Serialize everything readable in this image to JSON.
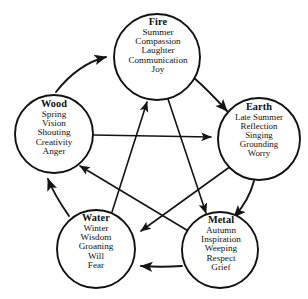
{
  "diagram": {
    "type": "five-elements-cycle",
    "line_color": "#141414",
    "background_color": "#ffffff",
    "nodes": [
      {
        "id": "fire",
        "name": "Fire",
        "attributes": [
          "Summer",
          "Compassion",
          "Laughter",
          "Communication",
          "Joy"
        ],
        "cx": 157,
        "cy": 57,
        "r": 43
      },
      {
        "id": "wood",
        "name": "Wood",
        "attributes": [
          "Spring",
          "Vision",
          "Shouting",
          "Creativity",
          "Anger"
        ],
        "cx": 54,
        "cy": 134,
        "r": 39
      },
      {
        "id": "earth",
        "name": "Earth",
        "attributes": [
          "Late Summer",
          "Reflection",
          "Singing",
          "Grounding",
          "Worry"
        ],
        "cx": 259,
        "cy": 139,
        "r": 41
      },
      {
        "id": "water",
        "name": "Water",
        "attributes": [
          "Winter",
          "Wisdom",
          "Groaning",
          "Will",
          "Fear"
        ],
        "cx": 96,
        "cy": 249,
        "r": 39
      },
      {
        "id": "metal",
        "name": "Metal",
        "attributes": [
          "Autumn",
          "Inspiration",
          "Weeping",
          "Respect",
          "Grief"
        ],
        "cx": 220,
        "cy": 250,
        "r": 38
      }
    ],
    "generating_cycle": [
      {
        "from": "wood",
        "to": "fire",
        "style": "curved"
      },
      {
        "from": "fire",
        "to": "earth",
        "style": "curved"
      },
      {
        "from": "earth",
        "to": "metal",
        "style": "curved"
      },
      {
        "from": "metal",
        "to": "water",
        "style": "straight"
      },
      {
        "from": "water",
        "to": "wood",
        "style": "curved"
      }
    ],
    "controlling_cycle": [
      {
        "from": "wood",
        "to": "earth",
        "style": "straight"
      },
      {
        "from": "earth",
        "to": "water",
        "style": "straight"
      },
      {
        "from": "water",
        "to": "fire",
        "style": "straight"
      },
      {
        "from": "fire",
        "to": "metal",
        "style": "straight"
      },
      {
        "from": "metal",
        "to": "wood",
        "style": "straight"
      }
    ]
  }
}
